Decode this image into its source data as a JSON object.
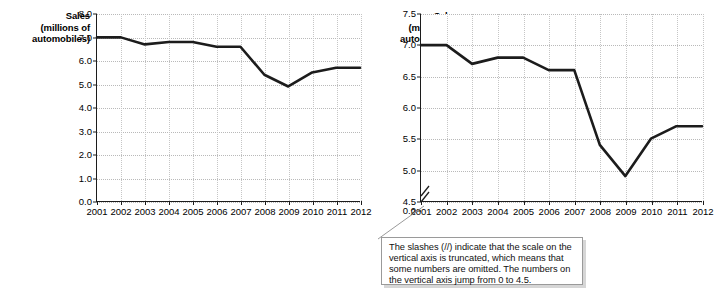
{
  "chart_data": [
    {
      "id": "left",
      "type": "line",
      "title": "",
      "ylabel": "Sales (millions of automobiles)",
      "ylabel_lines": [
        "Sales",
        "(millions of",
        "automobiles)"
      ],
      "xlabel": "",
      "categories": [
        "2001",
        "2002",
        "2003",
        "2004",
        "2005",
        "2006",
        "2007",
        "2008",
        "2009",
        "2010",
        "2011",
        "2012"
      ],
      "values": [
        7.0,
        7.0,
        6.7,
        6.8,
        6.8,
        6.6,
        6.6,
        5.4,
        4.9,
        5.5,
        5.7,
        5.7
      ],
      "ylim": [
        0.0,
        8.0
      ],
      "ytick_labels": [
        "8.0",
        "7.0",
        "6.0",
        "5.0",
        "4.0",
        "3.0",
        "2.0",
        "1.0",
        "0.0"
      ],
      "ytick_values": [
        8.0,
        7.0,
        6.0,
        5.0,
        4.0,
        3.0,
        2.0,
        1.0,
        0.0
      ],
      "grid": true,
      "legend": "none",
      "axis_truncated": false,
      "line_color": "#1c1c1c"
    },
    {
      "id": "right",
      "type": "line",
      "title": "",
      "ylabel": "Sales (millions of automobiles)",
      "ylabel_lines": [
        "Sales",
        "(millions of",
        "automobiles)"
      ],
      "xlabel": "",
      "categories": [
        "2001",
        "2002",
        "2003",
        "2004",
        "2005",
        "2006",
        "2007",
        "2008",
        "2009",
        "2010",
        "2011",
        "2012"
      ],
      "values": [
        7.0,
        7.0,
        6.7,
        6.8,
        6.8,
        6.6,
        6.6,
        5.4,
        4.9,
        5.5,
        5.7,
        5.7
      ],
      "ylim": [
        4.5,
        7.5
      ],
      "ytick_labels": [
        "7.5",
        "7.0",
        "6.5",
        "6.0",
        "5.5",
        "5.0",
        "4.5",
        "0.0"
      ],
      "ytick_values": [
        7.5,
        7.0,
        6.5,
        6.0,
        5.5,
        5.0,
        4.5,
        4.5
      ],
      "grid": true,
      "legend": "none",
      "axis_truncated": true,
      "truncation_symbol": "//",
      "line_color": "#1c1c1c"
    }
  ],
  "callout": {
    "text": "The slashes (//) indicate that the scale on the vertical axis is truncated, which means that some numbers are omitted.  The numbers on the vertical axis jump from 0 to 4.5.",
    "border_color": "#9a9a9a",
    "shadow_color": "#d6d6d6"
  },
  "colors": {
    "line": "#1c1c1c",
    "axis": "#1c1c1c",
    "grid": "#b9b9b9",
    "background": "#ffffff"
  }
}
